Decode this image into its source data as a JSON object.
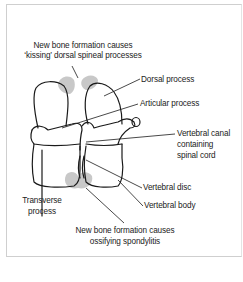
{
  "figure": {
    "labels": {
      "kissing_line1": "New bone formation causes",
      "kissing_line2": "‘kissing’ dorsal spineal processes",
      "dorsal_process": "Dorsal process",
      "articular_process": "Articular process",
      "vertebral_canal_line1": "Vertebral canal",
      "vertebral_canal_line2": "containing",
      "vertebral_canal_line3": "spinal cord",
      "vertebral_disc": "Vertebral disc",
      "vertebral_body": "Vertebral body",
      "transverse_line1": "Transverse",
      "transverse_line2": "process",
      "ossifying_line1": "New bone formation causes",
      "ossifying_line2": "ossifying spondylitis"
    },
    "colors": {
      "outline": "#1a1a1a",
      "new_bone_shading": "#c8c8c8",
      "frame_border": "#cfcfcf",
      "text": "#222222"
    }
  }
}
